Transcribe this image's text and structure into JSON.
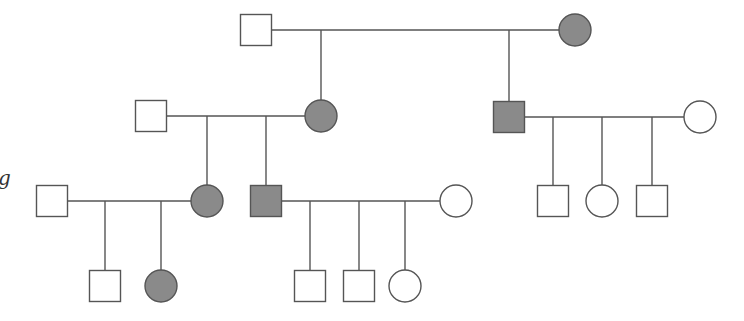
{
  "diagram": {
    "type": "pedigree",
    "colors": {
      "affected_fill": "#8a8a8a",
      "unaffected_fill": "#ffffff",
      "stroke": "#555555"
    },
    "stray_text": "g",
    "individuals": [
      {
        "id": "I-1",
        "sex": "male",
        "affected": false,
        "x": 256,
        "y": 30
      },
      {
        "id": "I-2",
        "sex": "female",
        "affected": true,
        "x": 575,
        "y": 30
      },
      {
        "id": "II-1",
        "sex": "male",
        "affected": false,
        "x": 151,
        "y": 116
      },
      {
        "id": "II-2",
        "sex": "female",
        "affected": true,
        "x": 321,
        "y": 116
      },
      {
        "id": "II-3",
        "sex": "male",
        "affected": true,
        "x": 509,
        "y": 117
      },
      {
        "id": "II-4",
        "sex": "female",
        "affected": false,
        "x": 700,
        "y": 117
      },
      {
        "id": "III-1",
        "sex": "male",
        "affected": false,
        "x": 52,
        "y": 201
      },
      {
        "id": "III-2",
        "sex": "female",
        "affected": true,
        "x": 207,
        "y": 201
      },
      {
        "id": "III-3",
        "sex": "male",
        "affected": true,
        "x": 266,
        "y": 201
      },
      {
        "id": "III-4",
        "sex": "female",
        "affected": false,
        "x": 456,
        "y": 201
      },
      {
        "id": "III-5",
        "sex": "male",
        "affected": false,
        "x": 553,
        "y": 201
      },
      {
        "id": "III-6",
        "sex": "female",
        "affected": false,
        "x": 602,
        "y": 201
      },
      {
        "id": "III-7",
        "sex": "male",
        "affected": false,
        "x": 652,
        "y": 201
      },
      {
        "id": "IV-1",
        "sex": "male",
        "affected": false,
        "x": 105,
        "y": 286
      },
      {
        "id": "IV-2",
        "sex": "female",
        "affected": true,
        "x": 161,
        "y": 286
      },
      {
        "id": "IV-3",
        "sex": "male",
        "affected": false,
        "x": 310,
        "y": 286
      },
      {
        "id": "IV-4",
        "sex": "male",
        "affected": false,
        "x": 359,
        "y": 286
      },
      {
        "id": "IV-5",
        "sex": "female",
        "affected": false,
        "x": 405,
        "y": 286
      }
    ],
    "matings": [
      {
        "partners": [
          "I-1",
          "I-2"
        ],
        "line_y": 30,
        "x1": 271,
        "x2": 559,
        "children": [
          "II-2",
          "II-3"
        ]
      },
      {
        "partners": [
          "II-1",
          "II-2"
        ],
        "line_y": 116,
        "x1": 166,
        "x2": 305,
        "children": [
          "III-2",
          "III-3"
        ]
      },
      {
        "partners": [
          "II-3",
          "II-4"
        ],
        "line_y": 117,
        "x1": 524,
        "x2": 684,
        "children": [
          "III-5",
          "III-6",
          "III-7"
        ]
      },
      {
        "partners": [
          "III-1",
          "III-2"
        ],
        "line_y": 201,
        "x1": 67,
        "x2": 191,
        "children": [
          "IV-1",
          "IV-2"
        ]
      },
      {
        "partners": [
          "III-3",
          "III-4"
        ],
        "line_y": 201,
        "x1": 281,
        "x2": 440,
        "children": [
          "IV-3",
          "IV-4",
          "IV-5"
        ]
      }
    ]
  }
}
